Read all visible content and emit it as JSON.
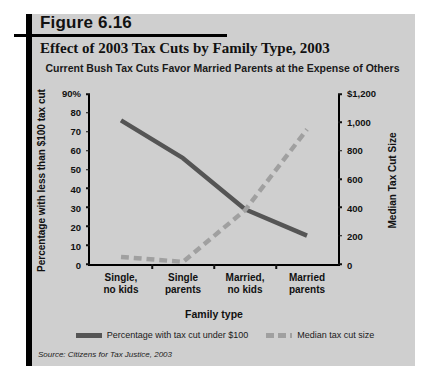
{
  "figure": {
    "number": "Figure 6.16",
    "title": "Effect of 2003 Tax Cuts by Family Type, 2003",
    "source": "Source: Citizens for Tax Justice, 2003"
  },
  "colors": {
    "panel_background": "#cfcfcf",
    "page_background": "#ffffff",
    "rule": "#000000",
    "series_percentage": "#555555",
    "series_median": "#a0a0a0"
  },
  "chart_data": {
    "type": "line",
    "title": "Current Bush Tax Cuts Favor Married Parents at the Expense of Others",
    "xlabel": "Family type",
    "ylabel": "Percentage with less than $100 tax cut",
    "y2label": "Median Tax Cut Size",
    "categories": [
      "Single,\nno kids",
      "Single\nparents",
      "Married,\nno kids",
      "Married\nparents"
    ],
    "category_labels": [
      [
        "Single,",
        "no kids"
      ],
      [
        "Single",
        "parents"
      ],
      [
        "Married,",
        "no kids"
      ],
      [
        "Married",
        "parents"
      ]
    ],
    "ylim": [
      0,
      90
    ],
    "yticks": [
      0,
      10,
      20,
      30,
      40,
      50,
      60,
      70,
      80,
      90
    ],
    "ytick_labels": [
      "0",
      "10",
      "20",
      "30",
      "40",
      "50",
      "60",
      "70",
      "80",
      "90%"
    ],
    "y2lim": [
      0,
      1200
    ],
    "y2ticks": [
      0,
      200,
      400,
      600,
      800,
      1000,
      1200
    ],
    "y2tick_labels": [
      "0",
      "200",
      "400",
      "600",
      "800",
      "1,000",
      "$1,200"
    ],
    "grid": false,
    "legend_position": "bottom",
    "series": [
      {
        "name": "Percentage with tax cut under $100",
        "axis": "left",
        "style": "solid",
        "color": "#555555",
        "values": [
          76,
          56,
          29,
          15
        ]
      },
      {
        "name": "Median tax cut size",
        "axis": "right",
        "style": "dashed",
        "color": "#a0a0a0",
        "values": [
          50,
          15,
          380,
          950
        ]
      }
    ]
  },
  "legend": {
    "items": [
      {
        "label": "Percentage with tax cut under $100",
        "style": "solid"
      },
      {
        "label": "Median tax cut size",
        "style": "dashed"
      }
    ]
  }
}
